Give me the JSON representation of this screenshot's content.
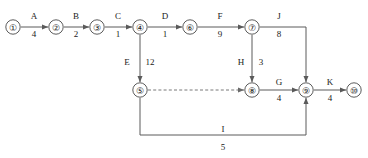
{
  "diagram": {
    "type": "activity-on-arrow-network",
    "nodes": [
      {
        "id": "1",
        "label": "①",
        "x": 13,
        "y": 27
      },
      {
        "id": "2",
        "label": "②",
        "x": 56,
        "y": 27
      },
      {
        "id": "3",
        "label": "③",
        "x": 97,
        "y": 27
      },
      {
        "id": "4",
        "label": "④",
        "x": 140,
        "y": 27
      },
      {
        "id": "6",
        "label": "⑥",
        "x": 190,
        "y": 27
      },
      {
        "id": "7",
        "label": "⑦",
        "x": 252,
        "y": 27
      },
      {
        "id": "5",
        "label": "⑤",
        "x": 140,
        "y": 90
      },
      {
        "id": "8",
        "label": "⑧",
        "x": 252,
        "y": 90
      },
      {
        "id": "9",
        "label": "⑨",
        "x": 306,
        "y": 90
      },
      {
        "id": "10",
        "label": "⑩",
        "x": 354,
        "y": 90
      }
    ],
    "activities": [
      {
        "name": "A",
        "duration": "4",
        "from": "1",
        "to": "2",
        "label_x": 34,
        "label_y": 16,
        "dur_x": 34,
        "dur_y": 35
      },
      {
        "name": "B",
        "duration": "2",
        "from": "2",
        "to": "3",
        "label_x": 76,
        "label_y": 16,
        "dur_x": 76,
        "dur_y": 35
      },
      {
        "name": "C",
        "duration": "1",
        "from": "3",
        "to": "4",
        "label_x": 118,
        "label_y": 16,
        "dur_x": 118,
        "dur_y": 35
      },
      {
        "name": "D",
        "duration": "1",
        "from": "4",
        "to": "6",
        "label_x": 165,
        "label_y": 16,
        "dur_x": 165,
        "dur_y": 35
      },
      {
        "name": "F",
        "duration": "9",
        "from": "6",
        "to": "7",
        "label_x": 220,
        "label_y": 16,
        "dur_x": 220,
        "dur_y": 35
      },
      {
        "name": "J",
        "duration": "8",
        "from": "7",
        "to": "9",
        "label_x": 279,
        "label_y": 16,
        "dur_x": 279,
        "dur_y": 35
      },
      {
        "name": "E",
        "duration": "12",
        "from": "4",
        "to": "5",
        "label_x": 127,
        "label_y": 62,
        "dur_x": 149,
        "dur_y": 62
      },
      {
        "name": "H",
        "duration": "3",
        "from": "7",
        "to": "8",
        "label_x": 240,
        "label_y": 62,
        "dur_x": 261,
        "dur_y": 62
      },
      {
        "name": "G",
        "duration": "4",
        "from": "8",
        "to": "9",
        "label_x": 279,
        "label_y": 83,
        "dur_x": 279,
        "dur_y": 100
      },
      {
        "name": "K",
        "duration": "4",
        "from": "9",
        "to": "10",
        "label_x": 330,
        "label_y": 83,
        "dur_x": 330,
        "dur_y": 100
      },
      {
        "name": "I",
        "duration": "5",
        "from": "5",
        "to": "9",
        "label_x": 223,
        "label_y": 132,
        "dur_x": 223,
        "dur_y": 150
      }
    ],
    "dummy_activities": [
      {
        "from": "5",
        "to": "8"
      }
    ],
    "colors": {
      "line": "#5a5a5a",
      "node_stroke": "#4a4a4a",
      "text": "#1a1a1a",
      "background": "#ffffff"
    }
  }
}
